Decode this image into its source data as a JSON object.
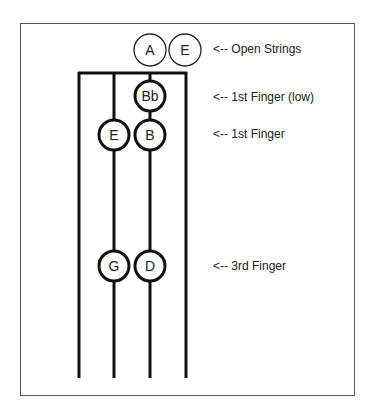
{
  "diagram": {
    "strings": [
      {
        "x": 79
      },
      {
        "x": 114
      },
      {
        "x": 150
      },
      {
        "x": 186
      }
    ],
    "open_strings": [
      {
        "note": "A",
        "cx": 150,
        "cy": 50
      },
      {
        "note": "E",
        "cx": 185,
        "cy": 50
      }
    ],
    "fingered_notes": [
      {
        "note": "Bb",
        "cx": 150,
        "cy": 96
      },
      {
        "note": "E",
        "cx": 114,
        "cy": 135
      },
      {
        "note": "B",
        "cx": 150,
        "cy": 135
      },
      {
        "note": "G",
        "cx": 114,
        "cy": 266
      },
      {
        "note": "D",
        "cx": 150,
        "cy": 266
      }
    ],
    "labels": [
      {
        "text": "<-- Open Strings",
        "y": 50
      },
      {
        "text": "<-- 1st Finger (low)",
        "y": 98
      },
      {
        "text": "<-- 1st Finger",
        "y": 135
      },
      {
        "text": "<-- 3rd Finger",
        "y": 267
      }
    ]
  }
}
